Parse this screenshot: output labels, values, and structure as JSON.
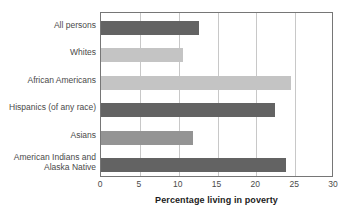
{
  "chart_data": {
    "type": "bar",
    "orientation": "horizontal",
    "title": "",
    "xlabel": "Percentage living in poverty",
    "ylabel": "",
    "xlim": [
      0,
      30
    ],
    "xticks": [
      0,
      5,
      10,
      15,
      20,
      25,
      30
    ],
    "grid": "vertical",
    "legend": "none",
    "categories": [
      "All persons",
      "Whites",
      "African Americans",
      "Hispanics (of any race)",
      "Asians",
      "American Indians and\nAlaska Native"
    ],
    "values": [
      12.6,
      10.5,
      24.5,
      22.4,
      11.8,
      23.8
    ],
    "bar_colors": [
      "#636363",
      "#c4c4c4",
      "#c4c4c4",
      "#636363",
      "#949494",
      "#636363"
    ],
    "axis_color": "#767676",
    "gridline_color": "#c8c8c8",
    "label_color": "#4a4a4a",
    "title_color": "#1c1c1c",
    "background_color": "#ffffff"
  }
}
